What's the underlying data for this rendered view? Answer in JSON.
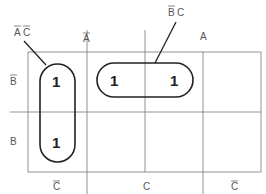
{
  "kmap": {
    "variables": [
      "A",
      "B",
      "C"
    ],
    "top_labels": {
      "not_a": "A",
      "a": "A"
    },
    "row_labels": {
      "not_b": "B",
      "b": "B"
    },
    "bottom_labels": {
      "not_c_left": "C",
      "c": "C",
      "not_c_right": "C"
    },
    "cells": [
      [
        "1",
        "1",
        "1",
        "",
        ""
      ],
      [
        "1",
        "",
        "",
        "",
        ""
      ]
    ],
    "cell_values": {
      "r0c0": "1",
      "r0c1": "1",
      "r0c2": "1",
      "r1c0": "1"
    },
    "groups": [
      {
        "label_1": "A",
        "label_2": "C",
        "overlined": [
          "A",
          "C"
        ],
        "term": "A̅C̅"
      },
      {
        "label_1": "B",
        "label_2": "C",
        "overlined": [
          "B"
        ],
        "term": "B̅C"
      }
    ]
  }
}
